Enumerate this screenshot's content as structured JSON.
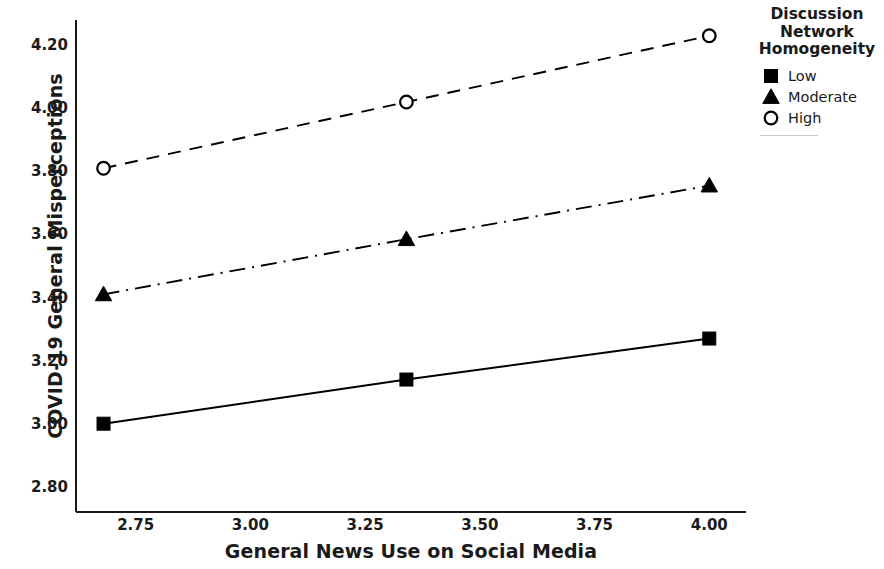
{
  "chart_data": {
    "type": "line",
    "title": "",
    "xlabel": "General News Use on Social Media",
    "ylabel": "COVID-19 General Misperceptions",
    "x": [
      2.68,
      3.34,
      4.0
    ],
    "xlim": [
      2.62,
      4.08
    ],
    "ylim": [
      2.72,
      4.28
    ],
    "xticks": [
      "2.75",
      "3.00",
      "3.25",
      "3.50",
      "3.75",
      "4.00"
    ],
    "xtick_values": [
      2.75,
      3.0,
      3.25,
      3.5,
      3.75,
      4.0
    ],
    "yticks": [
      "2.80",
      "3.00",
      "3.20",
      "3.40",
      "3.60",
      "3.80",
      "4.00",
      "4.20"
    ],
    "ytick_values": [
      2.8,
      3.0,
      3.2,
      3.4,
      3.6,
      3.8,
      4.0,
      4.2
    ],
    "grid": false,
    "legend_position": "right",
    "legend_title": "Discussion\nNetwork\nHomogeneity",
    "series": [
      {
        "name": "Low",
        "marker": "filled-square",
        "linestyle": "solid",
        "color": "#000000",
        "values": [
          3.0,
          3.14,
          3.27
        ]
      },
      {
        "name": "Moderate",
        "marker": "filled-triangle",
        "linestyle": "dash-dot",
        "color": "#000000",
        "values": [
          3.41,
          3.585,
          3.755
        ]
      },
      {
        "name": "High",
        "marker": "open-circle",
        "linestyle": "dashed",
        "color": "#000000",
        "values": [
          3.81,
          4.02,
          4.23
        ]
      }
    ]
  },
  "legend": {
    "title": "Discussion\nNetwork\nHomogeneity",
    "items": [
      {
        "label": "Low",
        "marker": "filled-square"
      },
      {
        "label": "Moderate",
        "marker": "filled-triangle"
      },
      {
        "label": "High",
        "marker": "open-circle"
      }
    ]
  }
}
